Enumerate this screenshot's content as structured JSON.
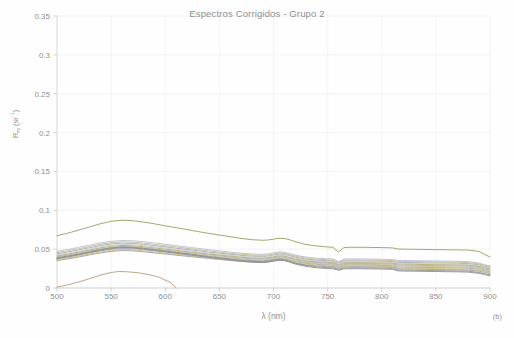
{
  "chart_data": {
    "type": "line",
    "title": "Espectros Corrigidos - Grupo 2",
    "xlabel": "λ (nm)",
    "ylabel_main": "R",
    "ylabel_sub": "rs",
    "ylabel_unit": "(sr",
    "ylabel_sup": "-1",
    "ylabel_unit_close": ")",
    "annotation": "(b)",
    "xlim": [
      500,
      900
    ],
    "ylim": [
      0,
      0.35
    ],
    "xticks": [
      500,
      550,
      600,
      650,
      700,
      750,
      800,
      850,
      900
    ],
    "xtick_labels": [
      "500",
      "550",
      "600",
      "650",
      "700",
      "750",
      "800",
      "850",
      "900"
    ],
    "yticks": [
      0,
      0.05,
      0.1,
      0.15,
      0.2,
      0.25,
      0.3,
      0.35
    ],
    "ytick_labels": [
      "0",
      "0.05",
      "0.1",
      "0.15",
      "0.2",
      "0.25",
      "0.3",
      "0.35"
    ],
    "grid": true,
    "legend": "none",
    "x": [
      500,
      510,
      520,
      530,
      540,
      550,
      560,
      570,
      580,
      590,
      600,
      610,
      620,
      630,
      640,
      650,
      660,
      670,
      680,
      690,
      695,
      700,
      705,
      710,
      715,
      720,
      730,
      740,
      750,
      755,
      760,
      765,
      770,
      780,
      790,
      800,
      810,
      815,
      820,
      830,
      840,
      850,
      860,
      870,
      880,
      890,
      895,
      900
    ],
    "series": [
      {
        "name": "spectrum-01-olive-high",
        "color": "#9a9b57",
        "values": [
          0.0672,
          0.0706,
          0.0745,
          0.0785,
          0.0826,
          0.0858,
          0.0872,
          0.0866,
          0.0848,
          0.0826,
          0.08,
          0.0776,
          0.0752,
          0.0727,
          0.0703,
          0.0681,
          0.066,
          0.0638,
          0.0622,
          0.0614,
          0.0618,
          0.0628,
          0.064,
          0.0638,
          0.062,
          0.0596,
          0.056,
          0.054,
          0.0528,
          0.0524,
          0.0462,
          0.052,
          0.0524,
          0.0524,
          0.0522,
          0.052,
          0.0516,
          0.0502,
          0.05,
          0.0498,
          0.0496,
          0.0494,
          0.0492,
          0.049,
          0.0488,
          0.047,
          0.043,
          0.04
        ]
      },
      {
        "name": "spectrum-02-blue-gray",
        "color": "#b7bed2",
        "values": [
          0.0472,
          0.0496,
          0.0522,
          0.0552,
          0.058,
          0.06,
          0.0612,
          0.0608,
          0.0596,
          0.058,
          0.0562,
          0.0545,
          0.0528,
          0.051,
          0.0494,
          0.0478,
          0.0462,
          0.0448,
          0.0438,
          0.0434,
          0.044,
          0.0452,
          0.0464,
          0.046,
          0.0444,
          0.0424,
          0.0398,
          0.0384,
          0.0376,
          0.0374,
          0.034,
          0.0372,
          0.0374,
          0.0374,
          0.0372,
          0.037,
          0.0366,
          0.0356,
          0.0354,
          0.0352,
          0.035,
          0.0348,
          0.0346,
          0.0344,
          0.034,
          0.032,
          0.03,
          0.0285
        ]
      },
      {
        "name": "spectrum-03-tan",
        "color": "#c3b98e",
        "values": [
          0.0455,
          0.0479,
          0.0505,
          0.0534,
          0.0562,
          0.0583,
          0.0594,
          0.059,
          0.0578,
          0.0562,
          0.0545,
          0.0528,
          0.0511,
          0.0494,
          0.0478,
          0.0462,
          0.0447,
          0.0434,
          0.0424,
          0.042,
          0.0426,
          0.0438,
          0.045,
          0.0446,
          0.043,
          0.041,
          0.0385,
          0.0371,
          0.0363,
          0.0361,
          0.033,
          0.0359,
          0.0361,
          0.0361,
          0.0359,
          0.0357,
          0.0353,
          0.0343,
          0.0341,
          0.0339,
          0.0337,
          0.0335,
          0.0333,
          0.0331,
          0.0327,
          0.0308,
          0.029,
          0.0276
        ]
      },
      {
        "name": "spectrum-04-gray",
        "color": "#a9a9a9",
        "values": [
          0.044,
          0.0464,
          0.049,
          0.0518,
          0.0546,
          0.0566,
          0.0577,
          0.0573,
          0.0561,
          0.0546,
          0.0529,
          0.0512,
          0.0496,
          0.0479,
          0.0463,
          0.0448,
          0.0433,
          0.042,
          0.041,
          0.0406,
          0.0412,
          0.0424,
          0.0436,
          0.0432,
          0.0416,
          0.0396,
          0.0372,
          0.0358,
          0.035,
          0.0348,
          0.0318,
          0.0346,
          0.0348,
          0.0348,
          0.0346,
          0.0344,
          0.034,
          0.033,
          0.0328,
          0.0326,
          0.0324,
          0.0322,
          0.032,
          0.0318,
          0.0314,
          0.0296,
          0.0278,
          0.0264
        ]
      },
      {
        "name": "spectrum-05-light-blue",
        "color": "#c5cbdc",
        "values": [
          0.0425,
          0.0449,
          0.0474,
          0.0502,
          0.053,
          0.055,
          0.0561,
          0.0557,
          0.0545,
          0.053,
          0.0514,
          0.0498,
          0.0482,
          0.0466,
          0.045,
          0.0435,
          0.0421,
          0.0408,
          0.0398,
          0.0394,
          0.04,
          0.0412,
          0.0424,
          0.042,
          0.0404,
          0.0384,
          0.036,
          0.0347,
          0.0339,
          0.0337,
          0.0309,
          0.0335,
          0.0337,
          0.0337,
          0.0335,
          0.0333,
          0.0329,
          0.0319,
          0.0317,
          0.0315,
          0.0313,
          0.0311,
          0.0309,
          0.0307,
          0.0303,
          0.0286,
          0.0268,
          0.0254
        ]
      },
      {
        "name": "spectrum-06-khaki",
        "color": "#b0ab6e",
        "values": [
          0.0412,
          0.0436,
          0.0461,
          0.0488,
          0.0516,
          0.0536,
          0.0547,
          0.0543,
          0.0531,
          0.0516,
          0.05,
          0.0484,
          0.0468,
          0.0453,
          0.0437,
          0.0423,
          0.0409,
          0.0396,
          0.0386,
          0.0382,
          0.0388,
          0.04,
          0.0412,
          0.0408,
          0.0392,
          0.0372,
          0.0349,
          0.0336,
          0.0328,
          0.0326,
          0.0298,
          0.0324,
          0.0326,
          0.0326,
          0.0324,
          0.0322,
          0.0318,
          0.0308,
          0.0306,
          0.0304,
          0.0302,
          0.03,
          0.0298,
          0.0296,
          0.0292,
          0.0276,
          0.0258,
          0.0244
        ]
      },
      {
        "name": "spectrum-07-warm-gray",
        "color": "#b5aca4",
        "values": [
          0.04,
          0.0424,
          0.0449,
          0.0476,
          0.0503,
          0.0523,
          0.0534,
          0.053,
          0.0518,
          0.0503,
          0.0488,
          0.0472,
          0.0456,
          0.0441,
          0.0426,
          0.0412,
          0.0398,
          0.0385,
          0.0375,
          0.0371,
          0.0377,
          0.0389,
          0.0401,
          0.0397,
          0.0381,
          0.0361,
          0.0339,
          0.0326,
          0.0318,
          0.0316,
          0.0289,
          0.0314,
          0.0316,
          0.0316,
          0.0314,
          0.0312,
          0.0308,
          0.0296,
          0.0294,
          0.0292,
          0.029,
          0.0288,
          0.0286,
          0.0284,
          0.028,
          0.0264,
          0.0246,
          0.0232
        ]
      },
      {
        "name": "spectrum-08-pale-olive",
        "color": "#bcbb91",
        "values": [
          0.0388,
          0.0411,
          0.0436,
          0.0463,
          0.049,
          0.051,
          0.0521,
          0.0517,
          0.0505,
          0.049,
          0.0475,
          0.0459,
          0.0444,
          0.0429,
          0.0414,
          0.04,
          0.0387,
          0.0374,
          0.0364,
          0.036,
          0.0366,
          0.0378,
          0.039,
          0.0386,
          0.037,
          0.035,
          0.0328,
          0.0315,
          0.0307,
          0.0305,
          0.0279,
          0.0303,
          0.0305,
          0.0305,
          0.0303,
          0.0301,
          0.0297,
          0.0283,
          0.0281,
          0.0279,
          0.0277,
          0.0275,
          0.0273,
          0.0271,
          0.0267,
          0.0252,
          0.0234,
          0.022
        ]
      },
      {
        "name": "spectrum-09-steel",
        "color": "#9fa5b5",
        "values": [
          0.0376,
          0.0399,
          0.0424,
          0.045,
          0.0477,
          0.0497,
          0.0508,
          0.0504,
          0.0492,
          0.0477,
          0.0462,
          0.0447,
          0.0432,
          0.0417,
          0.0403,
          0.0389,
          0.0376,
          0.0363,
          0.0353,
          0.0349,
          0.0355,
          0.0367,
          0.0379,
          0.0375,
          0.0359,
          0.0339,
          0.0317,
          0.0304,
          0.0296,
          0.0294,
          0.0269,
          0.0292,
          0.0294,
          0.0294,
          0.0292,
          0.029,
          0.0286,
          0.027,
          0.0268,
          0.0266,
          0.0264,
          0.0262,
          0.026,
          0.0258,
          0.0254,
          0.024,
          0.0222,
          0.0208
        ]
      },
      {
        "name": "spectrum-10-yellow",
        "color": "#cdc26a",
        "values": [
          0.0364,
          0.0387,
          0.0411,
          0.0437,
          0.0464,
          0.0484,
          0.0495,
          0.0491,
          0.0479,
          0.0464,
          0.0449,
          0.0434,
          0.042,
          0.0405,
          0.0391,
          0.0378,
          0.0365,
          0.0352,
          0.0342,
          0.0338,
          0.0344,
          0.0356,
          0.0368,
          0.0364,
          0.0348,
          0.0328,
          0.0307,
          0.0294,
          0.0286,
          0.0284,
          0.026,
          0.0282,
          0.0284,
          0.0284,
          0.0282,
          0.028,
          0.0276,
          0.0258,
          0.0256,
          0.0254,
          0.0252,
          0.025,
          0.0248,
          0.0246,
          0.0242,
          0.0228,
          0.0212,
          0.0198
        ]
      },
      {
        "name": "spectrum-11-mauve",
        "color": "#a99aa0",
        "values": [
          0.0352,
          0.0375,
          0.0399,
          0.0425,
          0.0451,
          0.0471,
          0.0482,
          0.0478,
          0.0466,
          0.0451,
          0.0437,
          0.0422,
          0.0408,
          0.0394,
          0.038,
          0.0367,
          0.0354,
          0.0341,
          0.0331,
          0.0327,
          0.0333,
          0.0345,
          0.0357,
          0.0353,
          0.0337,
          0.0317,
          0.0296,
          0.0283,
          0.0275,
          0.0273,
          0.025,
          0.0271,
          0.0273,
          0.0273,
          0.0271,
          0.0269,
          0.0265,
          0.0246,
          0.0244,
          0.0242,
          0.024,
          0.0238,
          0.0236,
          0.0234,
          0.023,
          0.0216,
          0.02,
          0.0186
        ]
      },
      {
        "name": "spectrum-12-dark-gray",
        "color": "#8e8e8e",
        "values": [
          0.0388,
          0.0412,
          0.0438,
          0.0466,
          0.0494,
          0.0516,
          0.0528,
          0.0524,
          0.051,
          0.0494,
          0.0476,
          0.0458,
          0.044,
          0.0422,
          0.0404,
          0.0387,
          0.0371,
          0.0356,
          0.0344,
          0.034,
          0.0346,
          0.0358,
          0.037,
          0.0364,
          0.0344,
          0.032,
          0.029,
          0.0272,
          0.0262,
          0.026,
          0.0238,
          0.0258,
          0.026,
          0.026,
          0.0258,
          0.0256,
          0.0252,
          0.0232,
          0.023,
          0.0228,
          0.0226,
          0.0224,
          0.0222,
          0.022,
          0.0216,
          0.02,
          0.0184,
          0.017
        ]
      },
      {
        "name": "spectrum-13-slate-low",
        "color": "#8a8d96",
        "values": [
          0.0378,
          0.0402,
          0.0428,
          0.0456,
          0.0486,
          0.0508,
          0.052,
          0.0516,
          0.0502,
          0.0485,
          0.0467,
          0.0449,
          0.043,
          0.0412,
          0.0394,
          0.0377,
          0.0361,
          0.0346,
          0.0334,
          0.033,
          0.0336,
          0.0348,
          0.036,
          0.0354,
          0.0333,
          0.0308,
          0.0278,
          0.026,
          0.025,
          0.0248,
          0.0227,
          0.0246,
          0.0248,
          0.0248,
          0.0246,
          0.0244,
          0.024,
          0.022,
          0.0218,
          0.0216,
          0.0214,
          0.0212,
          0.021,
          0.0208,
          0.0204,
          0.0188,
          0.0172,
          0.0158
        ]
      }
    ],
    "partial_series": [
      {
        "name": "spectrum-14-brown-low-partial",
        "color": "#b59a78",
        "x": [
          500,
          510,
          520,
          530,
          540,
          550,
          557,
          565,
          575,
          585,
          595,
          605,
          610
        ],
        "values": [
          0.0012,
          0.004,
          0.0077,
          0.012,
          0.0165,
          0.02,
          0.0212,
          0.0209,
          0.0196,
          0.0172,
          0.0135,
          0.0068,
          0.0002
        ]
      }
    ]
  }
}
